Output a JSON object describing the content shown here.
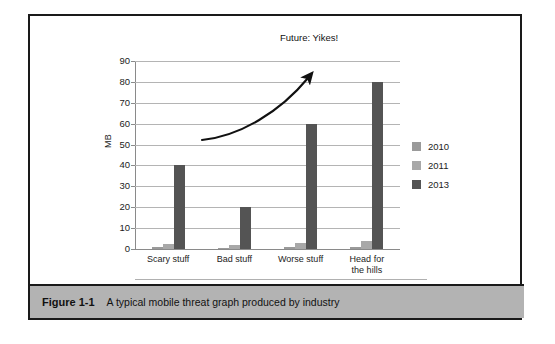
{
  "figure": {
    "caption_number": "Figure 1-1",
    "caption_text": "A typical mobile threat graph produced by industry"
  },
  "annotation": {
    "future_note": "Future: Yikes!"
  },
  "legend": {
    "items": [
      {
        "label": "2010",
        "color": "#9a9a9a"
      },
      {
        "label": "2011",
        "color": "#a8a8a8"
      },
      {
        "label": "2013",
        "color": "#545454"
      }
    ]
  },
  "chart_data": {
    "type": "bar",
    "title": "",
    "subtitle": "",
    "xlabel": "",
    "ylabel": "MB",
    "categories": [
      "Scary stuff",
      "Bad stuff",
      "Worse stuff",
      "Head for the hills"
    ],
    "series": [
      {
        "name": "2010",
        "color": "#9a9a9a",
        "values": [
          1,
          0.5,
          1,
          1
        ]
      },
      {
        "name": "2011",
        "color": "#a8a8a8",
        "values": [
          2.5,
          2,
          3,
          4
        ]
      },
      {
        "name": "2013",
        "color": "#545454",
        "values": [
          40,
          20,
          60,
          80
        ]
      }
    ],
    "ylim": [
      0,
      90
    ],
    "yticks": [
      0,
      10,
      20,
      30,
      40,
      50,
      60,
      70,
      80,
      90
    ],
    "ytick_labels": [
      "0",
      "10",
      "20",
      "30",
      "40",
      "50",
      "60",
      "70",
      "80",
      "90"
    ],
    "grid": true,
    "legend_position": "right",
    "annotations": [
      {
        "text": "Future: Yikes!",
        "type": "curved-arrow-label"
      }
    ]
  }
}
